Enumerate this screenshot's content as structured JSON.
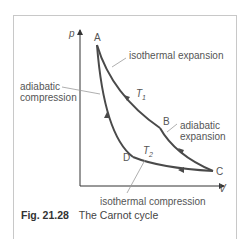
{
  "figure": {
    "number": "Fig. 21.28",
    "title": "The Carnot cycle"
  },
  "axes": {
    "y_label": "p",
    "x_label": "V"
  },
  "points": {
    "A": "A",
    "B": "B",
    "C": "C",
    "D": "D"
  },
  "temperatures": {
    "hot": "T",
    "hot_sub": "1",
    "cold": "T",
    "cold_sub": "2"
  },
  "annotations": {
    "isothermal_expansion": "isothermal expansion",
    "adiabatic_compression_1": "adiabatic",
    "adiabatic_compression_2": "compression",
    "adiabatic_expansion_1": "adiabatic",
    "adiabatic_expansion_2": "expansion",
    "isothermal_compression": "isothermal compression"
  },
  "colors": {
    "curve": "#4a4a4a",
    "axis": "#333333",
    "leader": "#9a9a9a",
    "frame": "#c8c8c8"
  }
}
